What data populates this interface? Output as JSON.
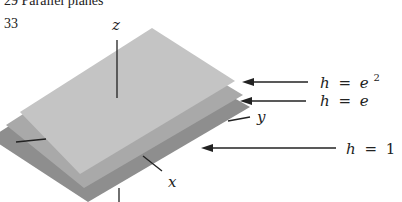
{
  "header": {
    "text": "29   Parallel planes"
  },
  "figure": {
    "number": "33",
    "axes": {
      "z": "z",
      "y": "y",
      "x": "x"
    },
    "planes": [
      {
        "label": "h = e²",
        "color": "#c4c4c4"
      },
      {
        "label": "h = e",
        "color": "#a9a9a9"
      },
      {
        "label": "h = 1",
        "color": "#8e8e8e"
      }
    ],
    "annotations": {
      "top": {
        "lhs": "h",
        "eq": "=",
        "rhs": "e",
        "sup": "2"
      },
      "mid": {
        "lhs": "h",
        "eq": "=",
        "rhs": "e"
      },
      "bot": {
        "lhs": "h",
        "eq": "=",
        "rhs": "1"
      }
    }
  }
}
